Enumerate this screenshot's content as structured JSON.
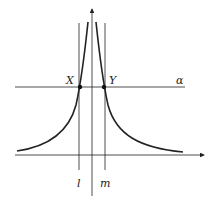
{
  "diagram": {
    "labels": {
      "point_x": "X",
      "point_y": "Y",
      "line_alpha": "α",
      "line_l": "l",
      "line_m": "m"
    },
    "colors": {
      "stroke": "#222222",
      "background": "#ffffff"
    }
  }
}
